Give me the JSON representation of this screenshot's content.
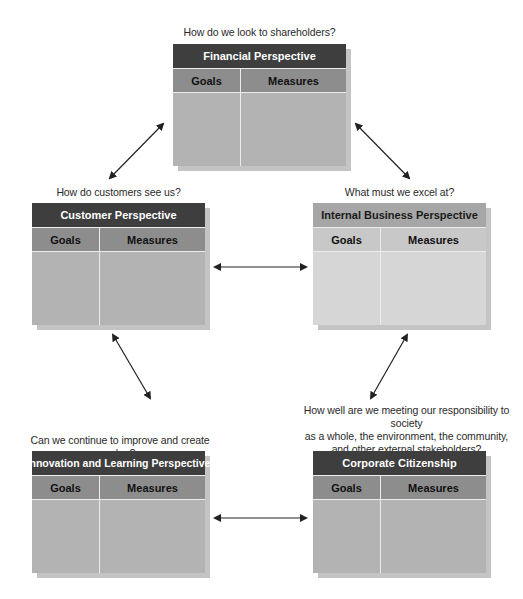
{
  "diagram": {
    "type": "balanced-scorecard",
    "perspectives": [
      {
        "id": "financial",
        "question": "How do we look to shareholders?",
        "title": "Financial Perspective",
        "columns": [
          "Goals",
          "Measures"
        ]
      },
      {
        "id": "customer",
        "question": "How do customers see us?",
        "title": "Customer Perspective",
        "columns": [
          "Goals",
          "Measures"
        ]
      },
      {
        "id": "internal",
        "question": "What must we excel at?",
        "title": "Internal Business Perspective",
        "columns": [
          "Goals",
          "Measures"
        ]
      },
      {
        "id": "innovation",
        "question": "Can we continue to improve and create value?",
        "title": "Innovation and Learning Perspective",
        "columns": [
          "Goals",
          "Measures"
        ]
      },
      {
        "id": "corporate",
        "question_lines": [
          "How well are we meeting our responsibility to society",
          "as a whole, the environment, the community,",
          "and other external stakeholders?"
        ],
        "title": "Corporate Citizenship",
        "columns": [
          "Goals",
          "Measures"
        ]
      }
    ],
    "connections": [
      {
        "from": "financial",
        "to": "customer",
        "type": "bidirectional"
      },
      {
        "from": "financial",
        "to": "internal",
        "type": "bidirectional"
      },
      {
        "from": "customer",
        "to": "internal",
        "type": "bidirectional"
      },
      {
        "from": "customer",
        "to": "innovation",
        "type": "bidirectional"
      },
      {
        "from": "internal",
        "to": "corporate",
        "type": "bidirectional"
      },
      {
        "from": "innovation",
        "to": "corporate",
        "type": "bidirectional"
      }
    ],
    "colors": {
      "title_dark": "#3e3e3e",
      "header_dark": "#8d8d8d",
      "body_dark": "#b3b3b3",
      "title_light": "#a6a6a6",
      "header_light": "#c8c8c8",
      "body_light": "#d6d6d6",
      "shadow": "#c4c4c4",
      "arrow": "#222222"
    }
  }
}
